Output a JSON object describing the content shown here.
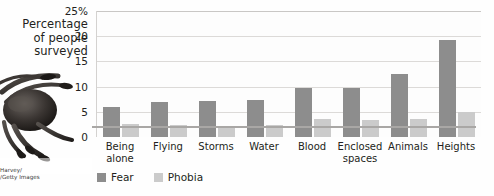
{
  "axis_title_lines": [
    "Percentage",
    "of people",
    "surveyed"
  ],
  "credit_lines": [
    "Harvey/",
    "/Getty Images"
  ],
  "photo": {
    "alt_name": "tarantula-spider-photo"
  },
  "legend": {
    "items": [
      {
        "label": "Fear",
        "color": "#8d8d8d"
      },
      {
        "label": "Phobia",
        "color": "#cbcbcb"
      }
    ]
  },
  "chart_data": {
    "type": "bar",
    "title": "",
    "xlabel": "",
    "ylabel": "Percentage of people surveyed",
    "ylim": [
      0,
      25
    ],
    "grid": true,
    "legend_position": "bottom-left",
    "ytick_labels": [
      "25%",
      "20",
      "15",
      "10",
      "5",
      "0"
    ],
    "ytick_values": [
      25,
      20,
      15,
      10,
      5,
      0
    ],
    "categories": [
      "Being alone",
      "Flying",
      "Storms",
      "Water",
      "Blood",
      "Enclosed spaces",
      "Animals",
      "Heights"
    ],
    "category_lines": [
      [
        "Being",
        "alone"
      ],
      [
        "Flying"
      ],
      [
        "Storms"
      ],
      [
        "Water"
      ],
      [
        "Blood"
      ],
      [
        "Enclosed",
        "spaces"
      ],
      [
        "Animals"
      ],
      [
        "Heights"
      ]
    ],
    "series": [
      {
        "name": "Fear",
        "color": "#8d8d8d",
        "values": [
          6.0,
          7.0,
          7.2,
          7.4,
          9.7,
          9.7,
          12.6,
          19.2
        ]
      },
      {
        "name": "Phobia",
        "color": "#cbcbcb",
        "values": [
          2.6,
          2.3,
          2.1,
          2.3,
          3.5,
          3.3,
          3.5,
          5.0
        ]
      }
    ]
  }
}
